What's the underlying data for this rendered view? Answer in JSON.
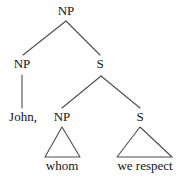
{
  "figure": {
    "kind": "syntax-tree",
    "background_color": "#ffffff",
    "line_color": "#4d4d4d",
    "text_color": "#141414"
  },
  "nodes": {
    "root_np": {
      "label": "NP",
      "x": 66,
      "y": 11
    },
    "left_np": {
      "label": "NP",
      "x": 22,
      "y": 64
    },
    "top_s": {
      "label": "S",
      "x": 100,
      "y": 64
    },
    "mid_np": {
      "label": "NP",
      "x": 62,
      "y": 117
    },
    "lower_s": {
      "label": "S",
      "x": 140,
      "y": 117
    }
  },
  "leaves": {
    "john": {
      "label": "John,",
      "x": 23,
      "y": 117
    },
    "whom": {
      "label": "whom",
      "x": 62,
      "y": 166
    },
    "we_respect": {
      "label": "we respect",
      "x": 145,
      "y": 166
    }
  },
  "edges": [
    {
      "name": "root-to-left-np",
      "x1": 66,
      "y1": 21,
      "x2": 23,
      "y2": 55
    },
    {
      "name": "root-to-top-s",
      "x1": 66,
      "y1": 21,
      "x2": 100,
      "y2": 55
    },
    {
      "name": "left-np-to-john",
      "x1": 22,
      "y1": 75,
      "x2": 22,
      "y2": 108
    },
    {
      "name": "top-s-to-mid-np",
      "x1": 101,
      "y1": 76,
      "x2": 62,
      "y2": 108
    },
    {
      "name": "top-s-to-lower-s",
      "x1": 101,
      "y1": 76,
      "x2": 140,
      "y2": 108
    }
  ],
  "triangles": [
    {
      "name": "whom-triangle",
      "apex_x": 62,
      "apex_y": 127,
      "left_x": 45,
      "right_x": 80,
      "base_y": 157
    },
    {
      "name": "we-respect-triangle",
      "apex_x": 140,
      "apex_y": 127,
      "left_x": 117,
      "right_x": 172,
      "base_y": 157
    }
  ]
}
